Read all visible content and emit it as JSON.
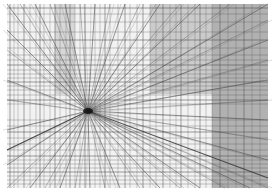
{
  "artwork": {
    "subject": "perspective line drawing with central vanishing point",
    "frame": {
      "x": 7,
      "y": 4,
      "width": 261,
      "height": 184
    },
    "vanishing_point": {
      "x": 88,
      "y": 111
    },
    "colors": {
      "background": "#ffffff",
      "paper": "#f2f2f2",
      "line": "#4a4a4a",
      "dark_panel": "#a8a8a8",
      "mid_panel": "#c8c8c8",
      "vanishing_core": "#111111"
    },
    "panels": [
      {
        "x": 212,
        "y": 4,
        "width": 56,
        "height": 184,
        "fill": "#a6a6a6"
      },
      {
        "x": 150,
        "y": 4,
        "width": 62,
        "height": 90,
        "fill": "#c4c4c4"
      },
      {
        "x": 55,
        "y": 4,
        "width": 20,
        "height": 90,
        "fill": "#d2d2d2"
      }
    ],
    "vertical_lines_x": [
      10,
      14,
      18,
      24,
      30,
      36,
      40,
      44,
      50,
      55,
      60,
      66,
      70,
      75,
      80,
      85,
      95,
      100,
      105,
      110,
      118,
      125,
      130,
      137,
      143,
      150,
      156,
      163,
      170,
      176,
      181,
      188,
      195,
      200,
      206,
      212,
      220,
      228,
      236,
      244,
      252,
      260
    ],
    "horizontal_lines_y": [
      8,
      14,
      22,
      32,
      40,
      48,
      55,
      60,
      65,
      70,
      74,
      78,
      82,
      86,
      90,
      95,
      100,
      104,
      120,
      126,
      132,
      138,
      144,
      150,
      156,
      160,
      164,
      168,
      172,
      176,
      180,
      184
    ],
    "radial_targets": [
      [
        7,
        4
      ],
      [
        20,
        4
      ],
      [
        35,
        4
      ],
      [
        50,
        4
      ],
      [
        65,
        4
      ],
      [
        80,
        4
      ],
      [
        95,
        4
      ],
      [
        110,
        4
      ],
      [
        125,
        4
      ],
      [
        140,
        4
      ],
      [
        160,
        4
      ],
      [
        180,
        4
      ],
      [
        200,
        4
      ],
      [
        230,
        4
      ],
      [
        268,
        4
      ],
      [
        268,
        20
      ],
      [
        268,
        40
      ],
      [
        268,
        60
      ],
      [
        268,
        80
      ],
      [
        268,
        100
      ],
      [
        268,
        120
      ],
      [
        268,
        140
      ],
      [
        268,
        160
      ],
      [
        268,
        188
      ],
      [
        250,
        188
      ],
      [
        225,
        188
      ],
      [
        200,
        188
      ],
      [
        180,
        188
      ],
      [
        160,
        188
      ],
      [
        140,
        188
      ],
      [
        120,
        188
      ],
      [
        105,
        188
      ],
      [
        90,
        188
      ],
      [
        75,
        188
      ],
      [
        60,
        188
      ],
      [
        45,
        188
      ],
      [
        30,
        188
      ],
      [
        7,
        188
      ],
      [
        7,
        165
      ],
      [
        7,
        150
      ],
      [
        7,
        130
      ],
      [
        7,
        100
      ],
      [
        7,
        80
      ],
      [
        7,
        50
      ],
      [
        7,
        30
      ]
    ]
  }
}
